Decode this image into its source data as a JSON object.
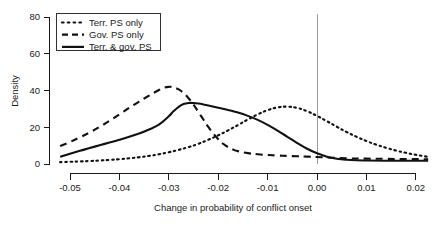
{
  "chart_data": {
    "type": "line",
    "title": "",
    "xlabel": "Change in probability of conflict onset",
    "ylabel": "Density",
    "xlim": [
      -0.055,
      0.0235
    ],
    "ylim": [
      0,
      80
    ],
    "xticks": [
      -0.05,
      -0.04,
      -0.03,
      -0.02,
      -0.01,
      0.0,
      0.01,
      0.02
    ],
    "xtick_labels": [
      "-0.05",
      "-0.04",
      "-0.03",
      "-0.02",
      "-0.01",
      "0.00",
      "0.01",
      "0.02"
    ],
    "yticks": [
      0,
      20,
      40,
      60,
      80
    ],
    "ytick_labels": [
      "0",
      "20",
      "40",
      "60",
      "80"
    ],
    "grid": false,
    "legend_position": "top-left",
    "annotations": [
      {
        "name": "zero-reference-line",
        "type": "vline",
        "x": 0.0,
        "color": "#9a9a9a"
      }
    ],
    "series": [
      {
        "name": "Terr. PS only",
        "style": "dotted",
        "color": "#111111",
        "x": [
          -0.052,
          -0.05,
          -0.048,
          -0.046,
          -0.044,
          -0.042,
          -0.04,
          -0.038,
          -0.036,
          -0.034,
          -0.032,
          -0.03,
          -0.028,
          -0.026,
          -0.024,
          -0.022,
          -0.02,
          -0.018,
          -0.016,
          -0.014,
          -0.012,
          -0.01,
          -0.008,
          -0.006,
          -0.004,
          -0.002,
          0.0,
          0.002,
          0.004,
          0.006,
          0.008,
          0.01,
          0.012,
          0.014,
          0.016,
          0.018,
          0.02,
          0.0225
        ],
        "values": [
          1.0,
          1.2,
          1.4,
          1.6,
          1.9,
          2.2,
          2.6,
          3.1,
          3.7,
          4.4,
          5.3,
          6.4,
          7.7,
          9.2,
          11.0,
          13.2,
          15.6,
          18.3,
          21.2,
          24.2,
          27.0,
          29.3,
          30.8,
          31.2,
          30.5,
          28.7,
          26.2,
          23.3,
          20.3,
          17.4,
          14.8,
          12.5,
          10.5,
          8.8,
          7.3,
          6.1,
          5.0,
          3.9
        ]
      },
      {
        "name": "Gov. PS only",
        "style": "dashed",
        "color": "#111111",
        "x": [
          -0.052,
          -0.05,
          -0.048,
          -0.046,
          -0.044,
          -0.042,
          -0.04,
          -0.038,
          -0.036,
          -0.034,
          -0.032,
          -0.031,
          -0.03,
          -0.029,
          -0.028,
          -0.027,
          -0.026,
          -0.025,
          -0.024,
          -0.023,
          -0.022,
          -0.021,
          -0.02,
          -0.019,
          -0.018,
          -0.017,
          -0.016,
          -0.014,
          -0.012,
          -0.01,
          -0.008,
          -0.006,
          -0.004,
          -0.002,
          0.0,
          0.003,
          0.006,
          0.01,
          0.014,
          0.018,
          0.0225
        ],
        "values": [
          9.8,
          12.0,
          14.5,
          17.2,
          20.2,
          23.5,
          27.0,
          30.6,
          34.0,
          37.2,
          40.3,
          41.5,
          42.0,
          41.7,
          40.6,
          38.6,
          35.8,
          32.3,
          28.3,
          24.2,
          20.2,
          16.6,
          13.5,
          11.0,
          9.2,
          7.9,
          7.0,
          5.9,
          5.3,
          4.9,
          4.6,
          4.4,
          4.2,
          4.0,
          3.8,
          3.4,
          3.1,
          2.9,
          2.8,
          2.7,
          2.6
        ]
      },
      {
        "name": "Terr. & gov. PS",
        "style": "solid",
        "color": "#111111",
        "x": [
          -0.052,
          -0.05,
          -0.048,
          -0.046,
          -0.044,
          -0.042,
          -0.04,
          -0.038,
          -0.036,
          -0.034,
          -0.032,
          -0.03,
          -0.029,
          -0.028,
          -0.027,
          -0.026,
          -0.025,
          -0.024,
          -0.023,
          -0.022,
          -0.02,
          -0.018,
          -0.016,
          -0.014,
          -0.012,
          -0.01,
          -0.008,
          -0.006,
          -0.004,
          -0.002,
          0.0,
          0.002,
          0.004,
          0.006,
          0.008,
          0.01,
          0.014,
          0.018,
          0.0225
        ],
        "values": [
          3.9,
          5.6,
          7.2,
          8.7,
          10.2,
          11.7,
          13.2,
          14.8,
          16.6,
          18.8,
          21.4,
          26.0,
          28.8,
          31.1,
          32.6,
          33.2,
          33.2,
          32.9,
          32.4,
          31.8,
          30.6,
          29.4,
          28.0,
          26.2,
          24.0,
          21.3,
          18.2,
          14.8,
          11.4,
          8.3,
          5.8,
          4.0,
          2.9,
          2.3,
          2.0,
          1.9,
          1.8,
          1.8,
          1.8
        ]
      }
    ]
  },
  "legend": {
    "entries": [
      {
        "label": "Terr. PS only",
        "style": "dotted"
      },
      {
        "label": "Gov. PS only",
        "style": "dashed"
      },
      {
        "label": "Terr. & gov. PS",
        "style": "solid"
      }
    ]
  }
}
